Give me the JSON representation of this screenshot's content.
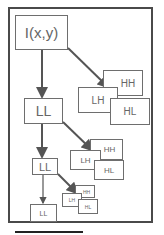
{
  "diagram": {
    "root": {
      "label": "I(x,y)"
    },
    "levels": [
      {
        "ll": "LL",
        "hh": "HH",
        "lh": "LH",
        "hl": "HL"
      },
      {
        "ll": "LL",
        "hh": "HH",
        "lh": "LH",
        "hl": "HL"
      },
      {
        "ll": "LL",
        "hh": "HH",
        "lh": "LH",
        "hl": "HL"
      }
    ],
    "colors": {
      "frame": "#4a4a4a",
      "box_border": "#6e6e6e",
      "arrow": "#555555",
      "text": "#666666"
    }
  }
}
